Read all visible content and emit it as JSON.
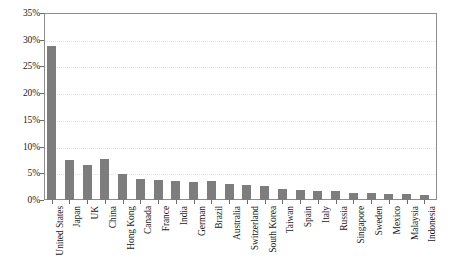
{
  "chart_data": {
    "type": "bar",
    "title": "",
    "subtitle": "",
    "xlabel": "",
    "ylabel": "",
    "grid": true,
    "legend": false,
    "orientation": "vertical",
    "bar_color": "#7d7d7d",
    "frame_color": "#8c8c8c",
    "gridline_color": "#e3e3e3",
    "background_color": "#ffffff",
    "ylim": [
      0,
      35
    ],
    "ytick_values": [
      0,
      5,
      10,
      15,
      20,
      25,
      30,
      35
    ],
    "ytick_labels": [
      "0%",
      "5%",
      "10%",
      "15%",
      "20%",
      "25%",
      "30%",
      "35%"
    ],
    "categories": [
      "United States",
      "Japan",
      "UK",
      "China",
      "Hong Kong",
      "Canada",
      "France",
      "India",
      "German",
      "Brazil",
      "Australia",
      "Switzerland",
      "South Korea",
      "Taiwan",
      "Spain",
      "Italy",
      "Russia",
      "Singapore",
      "Sweden",
      "Mexico",
      "Malaysia",
      "Indonesia"
    ],
    "values": [
      28.8,
      7.4,
      6.6,
      7.6,
      4.8,
      4.0,
      3.8,
      3.6,
      3.4,
      3.6,
      3.0,
      2.8,
      2.6,
      2.0,
      1.8,
      1.6,
      1.6,
      1.4,
      1.4,
      1.2,
      1.1,
      1.0
    ]
  }
}
